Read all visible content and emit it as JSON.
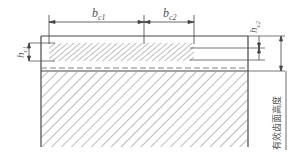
{
  "diagram": {
    "type": "cross-section",
    "colors": {
      "line": "#444444",
      "hatch": "#777777",
      "background": "#ffffff"
    },
    "labels": {
      "b_c1": {
        "base": "b",
        "sub": "c1"
      },
      "b_c2": {
        "base": "b",
        "sub": "c2"
      },
      "h_c1": {
        "base": "h",
        "sub": "c1"
      },
      "h_c2": {
        "base": "h",
        "sub": "c2"
      },
      "effective_depth": "有效齿面高度"
    }
  }
}
